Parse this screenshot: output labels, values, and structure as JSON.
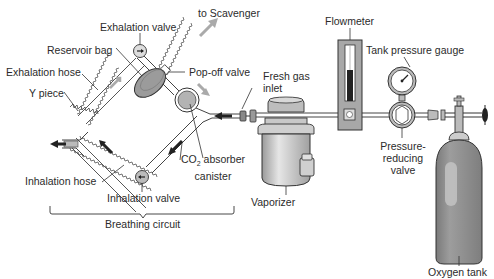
{
  "diagram": {
    "labels": {
      "to_scavenger": "to Scavenger",
      "exhalation_valve": "Exhalation valve",
      "reservoir_bag": "Reservoir bag",
      "exhalation_hose": "Exhalation hose",
      "pop_off_valve": "Pop-off valve",
      "y_piece": "Y piece",
      "fresh_gas_inlet_line1": "Fresh gas",
      "fresh_gas_inlet_line2": "inlet",
      "co2_absorber_line1_prefix": "CO",
      "co2_absorber_line1_sub": "2",
      "co2_absorber_line1_suffix": " absorber",
      "co2_absorber_line2": "canister",
      "inhalation_hose": "Inhalation hose",
      "inhalation_valve": "Inhalation valve",
      "breathing_circuit": "Breathing circuit",
      "vaporizer": "Vaporizer",
      "flowmeter": "Flowmeter",
      "tank_pressure_gauge": "Tank pressure gauge",
      "pressure_reducing_line1": "Pressure-",
      "pressure_reducing_line2": "reducing",
      "pressure_reducing_line3": "valve",
      "oxygen_tank": "Oxygen tank"
    },
    "colors": {
      "line": "#333333",
      "component_fill": "#a9a9a9",
      "component_dark": "#6e6e6e",
      "tank_fill": "#8c8c8c",
      "flow_arrow": "#222222",
      "gray_arrow": "#9a9a9a"
    }
  }
}
